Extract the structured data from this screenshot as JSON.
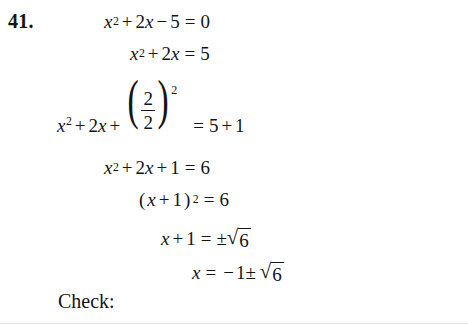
{
  "document": {
    "type": "math-worksheet-solution",
    "background_color": "#ffffff",
    "text_color": "#141414",
    "problem_number": "41.",
    "topic": "completing the square"
  },
  "equations": [
    {
      "id": "line1",
      "description": "original quadratic equation set equal to zero",
      "latex": "x^2 + 2x - 5 = 0",
      "tokens": {
        "var": "x",
        "exp": "2",
        "plus": "+",
        "coef2": "2",
        "var2": "x",
        "minus": "−",
        "five": "5",
        "equals": "=",
        "zero": "0"
      }
    },
    {
      "id": "line2",
      "description": "constant moved to right side",
      "latex": "x^2 + 2x = 5",
      "tokens": {
        "var": "x",
        "exp": "2",
        "plus": "+",
        "coef2": "2",
        "var2": "x",
        "equals": "=",
        "five": "5"
      }
    },
    {
      "id": "line3",
      "description": "add square of half the linear coefficient to both sides",
      "latex": "x^2 + 2x + \\left(\\frac{2}{2}\\right)^2 = 5 + 1",
      "tokens": {
        "var": "x",
        "exp": "2",
        "plus": "+",
        "coef2": "2",
        "var2": "x",
        "plus2": "+",
        "paren_open": "(",
        "frac_num": "2",
        "frac_den": "2",
        "paren_close": ")",
        "paren_exp": "2",
        "equals": "=",
        "five": "5",
        "plus3": "+",
        "one": "1"
      }
    },
    {
      "id": "line4",
      "description": "simplified perfect square trinomial",
      "latex": "x^2 + 2x + 1 = 6",
      "tokens": {
        "var": "x",
        "exp": "2",
        "plus": "+",
        "coef2": "2",
        "var2": "x",
        "plus2": "+",
        "one": "1",
        "equals": "=",
        "six": "6"
      }
    },
    {
      "id": "line5",
      "description": "factored as a binomial square",
      "latex": "(x + 1)^2 = 6",
      "tokens": {
        "paren_open": "(",
        "var": "x",
        "plus": "+",
        "one": "1",
        "paren_close": ")",
        "exp": "2",
        "equals": "=",
        "six": "6"
      }
    },
    {
      "id": "line6",
      "description": "square root of both sides",
      "latex": "x + 1 = \\pm\\sqrt{6}",
      "tokens": {
        "var": "x",
        "plus": "+",
        "one": "1",
        "equals": "=",
        "pm": "±",
        "radical": "√",
        "radicand": "6"
      }
    },
    {
      "id": "line7",
      "description": "solution for x",
      "latex": "x = -1 \\pm \\sqrt{6}",
      "tokens": {
        "var": "x",
        "equals": "=",
        "minus": "−",
        "one": "1",
        "pm": "±",
        "radical": "√",
        "radicand": "6"
      }
    }
  ],
  "footer": {
    "check_label": "Check:"
  }
}
